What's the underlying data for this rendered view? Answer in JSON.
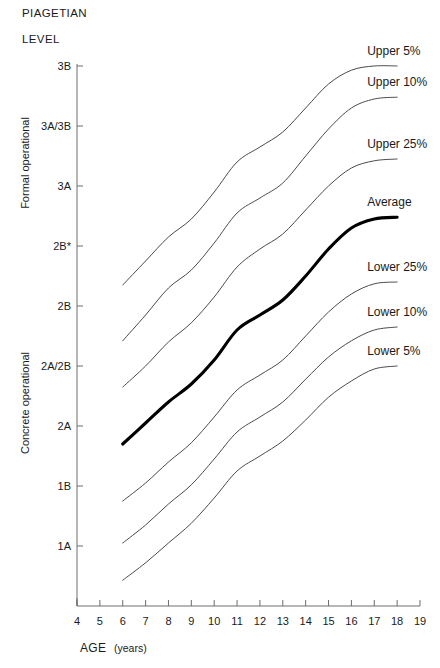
{
  "header": {
    "line1": "PIAGETIAN",
    "line2": "LEVEL"
  },
  "axis_titles": {
    "x_main": "AGE",
    "x_sub": "(years)",
    "y_upper_stage": "Formal operational",
    "y_lower_stage": "Concrete operational"
  },
  "chart_data": {
    "type": "line",
    "title": "PIAGETIAN LEVEL",
    "xlabel": "AGE (years)",
    "ylabel": "PIAGETIAN LEVEL",
    "grid": false,
    "legend_position": "inline-right-of-curve-ends",
    "xlim": [
      4,
      19
    ],
    "xticks": [
      4,
      5,
      6,
      7,
      8,
      9,
      10,
      11,
      12,
      13,
      14,
      15,
      16,
      17,
      18,
      19
    ],
    "xtick_labels": [
      "4",
      "5",
      "6",
      "7",
      "8",
      "9",
      "10",
      "11",
      "12",
      "13",
      "14",
      "15",
      "16",
      "17",
      "18",
      "19"
    ],
    "yticks_ordinal": [
      9,
      8,
      7,
      6,
      5,
      4,
      3,
      2,
      1
    ],
    "ytick_labels": [
      "3B",
      "3A/3B",
      "3A",
      "2B*",
      "2B",
      "2A/2B",
      "2A",
      "1B",
      "1A"
    ],
    "y_stage_groups": [
      {
        "name": "Formal operational",
        "levels": [
          "3B",
          "3A/3B",
          "3A",
          "2B*"
        ]
      },
      {
        "name": "Concrete operational",
        "levels": [
          "2B",
          "2A/2B",
          "2A",
          "1B",
          "1A"
        ]
      }
    ],
    "x": [
      6,
      7,
      8,
      9,
      10,
      11,
      12,
      13,
      14,
      15,
      16,
      17,
      18
    ],
    "series": [
      {
        "name": "Upper 5%",
        "label": "Upper 5%",
        "emphasis": "normal",
        "values_ordinal": [
          5.35,
          5.75,
          6.15,
          6.45,
          6.9,
          7.4,
          7.65,
          7.9,
          8.3,
          8.7,
          8.93,
          9.0,
          9.0
        ]
      },
      {
        "name": "Upper 10%",
        "label": "Upper 10%",
        "emphasis": "normal",
        "values_ordinal": [
          4.42,
          4.85,
          5.3,
          5.6,
          6.05,
          6.55,
          6.8,
          7.05,
          7.5,
          7.95,
          8.3,
          8.45,
          8.48
        ]
      },
      {
        "name": "Upper 25%",
        "label": "Upper 25%",
        "emphasis": "normal",
        "values_ordinal": [
          3.65,
          4.0,
          4.4,
          4.72,
          5.15,
          5.65,
          5.95,
          6.2,
          6.6,
          7.0,
          7.3,
          7.42,
          7.45
        ]
      },
      {
        "name": "Average",
        "label": "Average",
        "emphasis": "bold",
        "values_ordinal": [
          2.7,
          3.05,
          3.4,
          3.7,
          4.1,
          4.6,
          4.85,
          5.1,
          5.5,
          5.95,
          6.3,
          6.45,
          6.48
        ]
      },
      {
        "name": "Lower 25%",
        "label": "Lower 25%",
        "emphasis": "normal",
        "values_ordinal": [
          1.75,
          2.05,
          2.4,
          2.72,
          3.15,
          3.6,
          3.85,
          4.1,
          4.5,
          4.9,
          5.2,
          5.37,
          5.4
        ]
      },
      {
        "name": "Lower 10%",
        "label": "Lower 10%",
        "emphasis": "normal",
        "values_ordinal": [
          1.05,
          1.35,
          1.7,
          2.02,
          2.45,
          2.9,
          3.15,
          3.4,
          3.78,
          4.15,
          4.42,
          4.6,
          4.65
        ]
      },
      {
        "name": "Lower 5%",
        "label": "Lower 5%",
        "emphasis": "normal",
        "values_ordinal": [
          0.43,
          0.72,
          1.05,
          1.38,
          1.8,
          2.25,
          2.5,
          2.75,
          3.1,
          3.48,
          3.75,
          3.95,
          4.0
        ]
      }
    ]
  }
}
